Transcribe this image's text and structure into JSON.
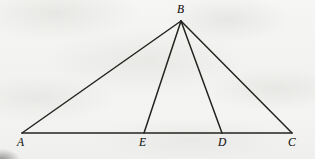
{
  "figure": {
    "background_color": "#f4f4f2",
    "stroke_color": "#232320",
    "label_color": "#24241f",
    "canvas": {
      "width": 315,
      "height": 159
    },
    "points": [
      {
        "id": "A",
        "label": "A",
        "x": 22,
        "y": 133,
        "label_x": 17,
        "label_y": 137
      },
      {
        "id": "B",
        "label": "B",
        "x": 181,
        "y": 21,
        "label_x": 177,
        "label_y": 4
      },
      {
        "id": "E",
        "label": "E",
        "x": 144,
        "y": 133,
        "label_x": 139,
        "label_y": 137
      },
      {
        "id": "D",
        "label": "D",
        "x": 222,
        "y": 133,
        "label_x": 218,
        "label_y": 137
      },
      {
        "id": "C",
        "label": "C",
        "x": 292,
        "y": 133,
        "label_x": 288,
        "label_y": 137
      }
    ],
    "segments": [
      {
        "id": "AB",
        "name": "segment-ab",
        "from": "A",
        "to": "B",
        "width": 1.5
      },
      {
        "id": "BC",
        "name": "segment-bc",
        "from": "B",
        "to": "C",
        "width": 1.5
      },
      {
        "id": "AC",
        "name": "segment-ac-base",
        "from": "A",
        "to": "C",
        "width": 1.6
      },
      {
        "id": "BE",
        "name": "cevian-be",
        "from": "B",
        "to": "E",
        "width": 1.5
      },
      {
        "id": "BD",
        "name": "cevian-bd",
        "from": "B",
        "to": "D",
        "width": 1.5
      }
    ]
  }
}
